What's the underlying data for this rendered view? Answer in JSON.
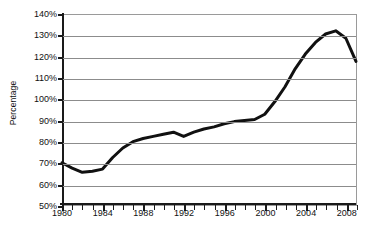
{
  "chart_data": {
    "type": "line",
    "title": "",
    "subtitle": "",
    "xlabel": "",
    "ylabel": "Percentage",
    "xlim": [
      1980,
      2009
    ],
    "ylim": [
      50,
      140
    ],
    "y_tick_labels": [
      "140%",
      "130%",
      "120%",
      "110%",
      "100%",
      "90%",
      "80%",
      "70%",
      "60%",
      "50%"
    ],
    "y_tick_values": [
      140,
      130,
      120,
      110,
      100,
      90,
      80,
      70,
      60,
      50
    ],
    "x_tick_labels": [
      "1980",
      "1984",
      "1988",
      "1992",
      "1996",
      "2000",
      "2004",
      "2008"
    ],
    "x_tick_values": [
      1980,
      1984,
      1988,
      1992,
      1996,
      2000,
      2004,
      2008
    ],
    "x_minor_ticks": [
      1981,
      1982,
      1983,
      1985,
      1986,
      1987,
      1989,
      1990,
      1991,
      1993,
      1994,
      1995,
      1997,
      1998,
      1999,
      2001,
      2002,
      2003,
      2005,
      2006,
      2007,
      2009
    ],
    "grid": "horizontal",
    "legend": "none",
    "line_color": "#111111",
    "line_width": 3,
    "x": [
      1980,
      1981,
      1982,
      1983,
      1984,
      1985,
      1986,
      1987,
      1988,
      1989,
      1990,
      1991,
      1992,
      1993,
      1994,
      1995,
      1996,
      1997,
      1998,
      1999,
      2000,
      2001,
      2002,
      2003,
      2004,
      2005,
      2006,
      2007,
      2008,
      2009
    ],
    "values": [
      70.0,
      67.5,
      65.5,
      66.0,
      67.0,
      72.5,
      77.0,
      80.0,
      81.5,
      82.5,
      83.5,
      84.5,
      82.5,
      84.5,
      86.0,
      87.0,
      88.5,
      89.5,
      90.0,
      90.5,
      93.0,
      99.0,
      106.0,
      114.5,
      121.5,
      127.0,
      131.0,
      132.5,
      129.0,
      118.0
    ],
    "series": [
      {
        "name": "Percentage",
        "values": [
          70.0,
          67.5,
          65.5,
          66.0,
          67.0,
          72.5,
          77.0,
          80.0,
          81.5,
          82.5,
          83.5,
          84.5,
          82.5,
          84.5,
          86.0,
          87.0,
          88.5,
          89.5,
          90.0,
          90.5,
          93.0,
          99.0,
          106.0,
          114.5,
          121.5,
          127.0,
          131.0,
          132.5,
          129.0,
          118.0
        ]
      }
    ],
    "annotations": []
  },
  "caption": {
    "text": ""
  }
}
